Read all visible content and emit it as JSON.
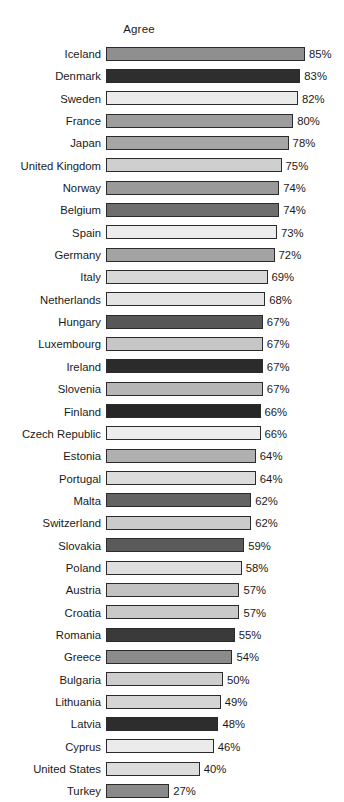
{
  "chart_data": {
    "type": "bar",
    "orientation": "horizontal",
    "title": "Agree",
    "xlabel": "",
    "ylabel": "",
    "xlim": [
      0,
      85
    ],
    "grid": false,
    "legend": null,
    "value_suffix": "%",
    "categories": [
      "Iceland",
      "Denmark",
      "Sweden",
      "France",
      "Japan",
      "United Kingdom",
      "Norway",
      "Belgium",
      "Spain",
      "Germany",
      "Italy",
      "Netherlands",
      "Hungary",
      "Luxembourg",
      "Ireland",
      "Slovenia",
      "Finland",
      "Czech Republic",
      "Estonia",
      "Portugal",
      "Malta",
      "Switzerland",
      "Slovakia",
      "Poland",
      "Austria",
      "Croatia",
      "Romania",
      "Greece",
      "Bulgaria",
      "Lithuania",
      "Latvia",
      "Cyprus",
      "United States",
      "Turkey"
    ],
    "values": [
      85,
      83,
      82,
      80,
      78,
      75,
      74,
      74,
      73,
      72,
      69,
      68,
      67,
      67,
      67,
      67,
      66,
      66,
      64,
      64,
      62,
      62,
      59,
      58,
      57,
      57,
      55,
      54,
      50,
      49,
      48,
      46,
      40,
      27
    ],
    "value_labels": [
      "85%",
      "83%",
      "82%",
      "80%",
      "78%",
      "75%",
      "74%",
      "74%",
      "73%",
      "72%",
      "69%",
      "68%",
      "67%",
      "67%",
      "67%",
      "67%",
      "66%",
      "66%",
      "64%",
      "64%",
      "62%",
      "62%",
      "59%",
      "58%",
      "57%",
      "57%",
      "55%",
      "54%",
      "50%",
      "49%",
      "48%",
      "46%",
      "40%",
      "27%"
    ],
    "bar_colors": [
      "#8f8f8f",
      "#2e2e2e",
      "#ebebeb",
      "#9d9d9d",
      "#a6a6a6",
      "#cfcfcf",
      "#9a9a9a",
      "#6e6e6e",
      "#ececec",
      "#a3a3a3",
      "#d8d8d8",
      "#e4e4e4",
      "#575757",
      "#c6c6c6",
      "#2b2b2b",
      "#b6b6b6",
      "#262626",
      "#ededed",
      "#b0b0b0",
      "#dcdcdc",
      "#636363",
      "#cbcbcb",
      "#5a5a5a",
      "#dedede",
      "#c2c2c2",
      "#c9c9c9",
      "#3a3a3a",
      "#8b8b8b",
      "#cdcdcd",
      "#d5d5d5",
      "#2d2d2d",
      "#ebebeb",
      "#dcdcdc",
      "#8a8a8a"
    ]
  }
}
